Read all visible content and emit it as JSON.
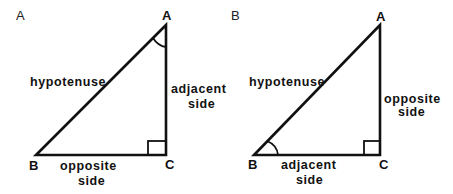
{
  "panels": [
    {
      "panel_label": "A",
      "vertices": {
        "top": "A",
        "bottom_left": "B",
        "bottom_right": "C"
      },
      "marked_angle": "A",
      "sides": {
        "hypotenuse": "hypotenuse",
        "vertical": {
          "line1": "adjacent",
          "line2": "side"
        },
        "horizontal": {
          "line1": "opposite",
          "line2": "side"
        }
      }
    },
    {
      "panel_label": "B",
      "vertices": {
        "top": "A",
        "bottom_left": "B",
        "bottom_right": "C"
      },
      "marked_angle": "B",
      "sides": {
        "hypotenuse": "hypotenuse",
        "vertical": {
          "line1": "opposite",
          "line2": "side"
        },
        "horizontal": {
          "line1": "adjacent",
          "line2": "side"
        }
      }
    }
  ],
  "colors": {
    "stroke": "#111111",
    "background": "#ffffff"
  }
}
